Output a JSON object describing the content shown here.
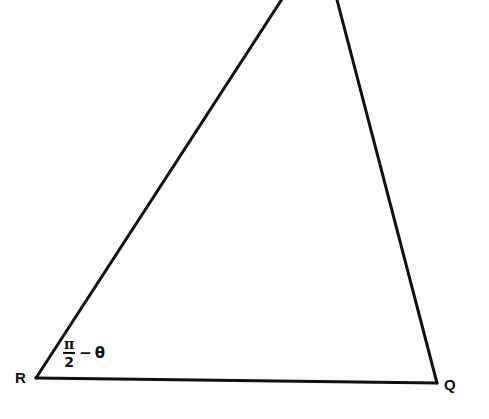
{
  "diagram": {
    "type": "triangle",
    "vertices": {
      "R": {
        "label": "R",
        "x": 36,
        "y": 378
      },
      "Q": {
        "label": "Q",
        "x": 437,
        "y": 383
      },
      "P": {
        "label": "",
        "x": 310,
        "y": -40,
        "note": "apex off-frame above top edge"
      }
    },
    "angle_at_R": {
      "numerator": "π",
      "denominator": "2",
      "operator": "−",
      "variable": "θ",
      "text": "π/2 − θ"
    },
    "stroke_color": "#111111",
    "background_color": "#ffffff"
  }
}
